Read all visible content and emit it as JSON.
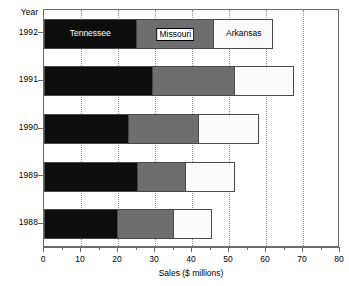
{
  "chart_data": {
    "type": "bar",
    "orientation": "horizontal",
    "stacked": true,
    "title": "",
    "xlabel": "Sales ($ millions)",
    "ylabel": "Year",
    "xlim": [
      0,
      80
    ],
    "xticks": [
      0,
      10,
      20,
      30,
      40,
      50,
      60,
      70,
      80
    ],
    "xtick_labels": [
      "0",
      "10",
      "20",
      "30",
      "40",
      "50",
      "60",
      "70",
      "80"
    ],
    "xtick_minor_step": 5,
    "grid": "vertical-dotted",
    "legend": "in-bar labels on 1992 row",
    "categories": [
      "1992",
      "1991",
      "1990",
      "1989",
      "1988"
    ],
    "series": [
      {
        "name": "Tennessee",
        "color": "#0d0d0d",
        "text_color": "#ffffff",
        "values": [
          25.0,
          29.5,
          23.0,
          25.5,
          20.0
        ]
      },
      {
        "name": "Missouri",
        "color": "#6e6e6e",
        "text_color": "#000000",
        "values": [
          21.0,
          22.0,
          19.0,
          13.0,
          15.0
        ]
      },
      {
        "name": "Arkansas",
        "color": "#fbfbfb",
        "text_color": "#000000",
        "values": [
          16.0,
          16.0,
          16.0,
          13.0,
          10.5
        ]
      }
    ],
    "cumulative_totals": [
      62.0,
      67.5,
      58.0,
      51.5,
      45.5
    ],
    "annotations": [
      {
        "text": "Tennessee",
        "row": "1992",
        "segment": "Tennessee",
        "style": "white-text-on-black"
      },
      {
        "text": "Missouri",
        "row": "1992",
        "segment": "Missouri",
        "style": "black-text-white-box"
      },
      {
        "text": "Arkansas",
        "row": "1992",
        "segment": "Arkansas",
        "style": "black-text-on-white"
      }
    ],
    "axis_color": "#6b6b6b",
    "bar_edge_color": "#4a4a4a",
    "grid_color": "#909090"
  }
}
